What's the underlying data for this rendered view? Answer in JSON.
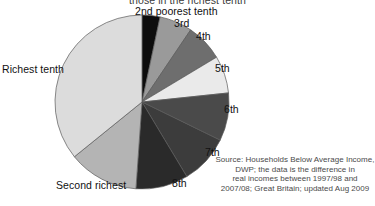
{
  "title_clipped": "those in the richest tenth",
  "labels": {
    "second_poorest": "2nd poorest tenth",
    "third": "3rd",
    "fourth": "4th",
    "fifth": "5th",
    "sixth": "6th",
    "seventh": "7th",
    "eighth": "8th",
    "second_richest": "Second richest",
    "richest": "Richest tenth"
  },
  "source": {
    "line1": "Source: Households Below Average Income,",
    "line2": "DWP; the data is the difference in",
    "line3": "real incomes between 1997/98 and",
    "line4": "2007/08; Great Britain; updated Aug 2009"
  },
  "chart_data": {
    "type": "pie",
    "title": "those in the richest tenth",
    "xlabel": "",
    "ylabel": "",
    "grid": false,
    "legend_position": "none",
    "labels_outside": true,
    "start_angle_deg": 0,
    "direction": "clockwise",
    "center": [
      142,
      102
    ],
    "radius": 87,
    "unit": "share of total real income gain (%)",
    "slices": [
      {
        "label": "2nd poorest tenth",
        "angle_deg": 12,
        "value": 3.3,
        "color": "#0d0d0d"
      },
      {
        "label": "3rd",
        "angle_deg": 22,
        "value": 6.1,
        "color": "#9a9a9a"
      },
      {
        "label": "4th",
        "angle_deg": 25,
        "value": 6.9,
        "color": "#6e6e6e"
      },
      {
        "label": "5th",
        "angle_deg": 25,
        "value": 6.9,
        "color": "#eaeaea"
      },
      {
        "label": "6th",
        "angle_deg": 32,
        "value": 8.9,
        "color": "#4a4a4a"
      },
      {
        "label": "7th",
        "angle_deg": 33,
        "value": 9.2,
        "color": "#3c3c3c"
      },
      {
        "label": "8th",
        "angle_deg": 35,
        "value": 9.7,
        "color": "#2a2a2a"
      },
      {
        "label": "Second richest",
        "angle_deg": 47,
        "value": 13.1,
        "color": "#b4b4b4"
      },
      {
        "label": "Richest tenth",
        "angle_deg": 129,
        "value": 35.9,
        "color": "#dcdcdc"
      }
    ]
  },
  "colors": {
    "background": "#ffffff",
    "outline": "#5a5a5a",
    "text": "#111111",
    "source_text": "#4a4a4a"
  }
}
